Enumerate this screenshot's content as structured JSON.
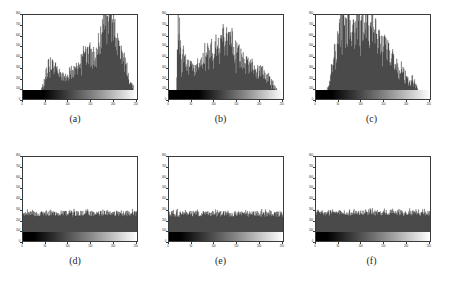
{
  "figure": {
    "caption_prefix": "",
    "panel_count": 6,
    "background": "#ffffff",
    "bar_color": "#4a4a4a",
    "axis_color": "#3a3a3a"
  },
  "chart_data": [
    {
      "type": "bar",
      "name": "panel-a",
      "title": "",
      "caption": "(a)",
      "xlabel": "",
      "ylabel": "",
      "xlim": [
        0,
        255
      ],
      "ylim": [
        0,
        800
      ],
      "xticks": [
        0,
        50,
        100,
        150,
        200,
        250
      ],
      "xticklabels": [
        "0",
        "50",
        "100",
        "150",
        "200",
        "250"
      ],
      "yticks": [
        0,
        100,
        200,
        300,
        400,
        500,
        600,
        700,
        800
      ],
      "yticklabels": [
        "0",
        "100",
        "200",
        "300",
        "400",
        "500",
        "600",
        "700",
        "800"
      ],
      "grid": false,
      "legend": null,
      "colorbar": {
        "type": "grayscale",
        "from": "#000000",
        "to": "#ffffff",
        "black_extent_pct": 18,
        "gamma": 1.0
      },
      "x": [
        0,
        4,
        8,
        12,
        16,
        20,
        24,
        28,
        32,
        36,
        40,
        44,
        48,
        52,
        56,
        60,
        64,
        68,
        72,
        76,
        80,
        84,
        88,
        92,
        96,
        100,
        104,
        108,
        112,
        116,
        120,
        124,
        128,
        132,
        136,
        140,
        144,
        148,
        152,
        156,
        160,
        164,
        168,
        172,
        176,
        180,
        184,
        188,
        192,
        196,
        200,
        204,
        208,
        212,
        216,
        220,
        224,
        228,
        232,
        236,
        240,
        244,
        248,
        252
      ],
      "values": [
        5,
        6,
        8,
        10,
        12,
        14,
        18,
        22,
        30,
        45,
        70,
        110,
        160,
        230,
        300,
        330,
        345,
        320,
        290,
        260,
        240,
        220,
        205,
        195,
        200,
        215,
        235,
        250,
        265,
        270,
        280,
        300,
        330,
        360,
        390,
        420,
        430,
        420,
        400,
        380,
        370,
        400,
        450,
        520,
        600,
        680,
        740,
        790,
        800,
        760,
        700,
        640,
        580,
        520,
        470,
        420,
        380,
        330,
        280,
        230,
        180,
        130,
        90,
        50
      ]
    },
    {
      "type": "bar",
      "name": "panel-b",
      "title": "",
      "caption": "(b)",
      "xlabel": "",
      "ylabel": "",
      "xlim": [
        0,
        255
      ],
      "ylim": [
        0,
        800
      ],
      "xticks": [
        0,
        50,
        100,
        150,
        200,
        250
      ],
      "xticklabels": [
        "0",
        "50",
        "100",
        "150",
        "200",
        "250"
      ],
      "yticks": [
        0,
        100,
        200,
        300,
        400,
        500,
        600,
        700,
        800
      ],
      "yticklabels": [
        "0",
        "100",
        "200",
        "300",
        "400",
        "500",
        "600",
        "700",
        "800"
      ],
      "grid": false,
      "legend": null,
      "colorbar": {
        "type": "grayscale",
        "from": "#000000",
        "to": "#ffffff",
        "black_extent_pct": 26,
        "gamma": 1.0
      },
      "x": [
        0,
        4,
        8,
        12,
        16,
        20,
        24,
        28,
        32,
        36,
        40,
        44,
        48,
        52,
        56,
        60,
        64,
        68,
        72,
        76,
        80,
        84,
        88,
        92,
        96,
        100,
        104,
        108,
        112,
        116,
        120,
        124,
        128,
        132,
        136,
        140,
        144,
        148,
        152,
        156,
        160,
        164,
        168,
        172,
        176,
        180,
        184,
        188,
        192,
        196,
        200,
        204,
        208,
        212,
        216,
        220,
        224,
        228,
        232,
        236,
        240,
        244,
        248,
        252
      ],
      "values": [
        4,
        6,
        10,
        18,
        30,
        800,
        520,
        230,
        470,
        300,
        380,
        260,
        330,
        280,
        250,
        300,
        340,
        290,
        380,
        330,
        400,
        360,
        440,
        400,
        460,
        420,
        480,
        440,
        520,
        470,
        560,
        500,
        540,
        480,
        620,
        520,
        480,
        440,
        420,
        400,
        380,
        360,
        340,
        320,
        300,
        280,
        300,
        270,
        250,
        230,
        260,
        240,
        300,
        260,
        220,
        200,
        180,
        160,
        140,
        120,
        90,
        60,
        40,
        20
      ]
    },
    {
      "type": "bar",
      "name": "panel-c",
      "title": "",
      "caption": "(c)",
      "xlabel": "",
      "ylabel": "",
      "xlim": [
        0,
        255
      ],
      "ylim": [
        0,
        800
      ],
      "xticks": [
        0,
        50,
        100,
        150,
        200,
        250
      ],
      "xticklabels": [
        "0",
        "50",
        "100",
        "150",
        "200",
        "250"
      ],
      "yticks": [
        0,
        100,
        200,
        300,
        400,
        500,
        600,
        700,
        800
      ],
      "yticklabels": [
        "0",
        "100",
        "200",
        "300",
        "400",
        "500",
        "600",
        "700",
        "800"
      ],
      "grid": false,
      "legend": null,
      "colorbar": {
        "type": "grayscale",
        "from": "#000000",
        "to": "#ffffff",
        "black_extent_pct": 14,
        "gamma": 1.0
      },
      "x": [
        0,
        4,
        8,
        12,
        16,
        20,
        24,
        28,
        32,
        36,
        40,
        44,
        48,
        52,
        56,
        60,
        64,
        68,
        72,
        76,
        80,
        84,
        88,
        92,
        96,
        100,
        104,
        108,
        112,
        116,
        120,
        124,
        128,
        132,
        136,
        140,
        144,
        148,
        152,
        156,
        160,
        164,
        168,
        172,
        176,
        180,
        184,
        188,
        192,
        196,
        200,
        204,
        208,
        212,
        216,
        220,
        224,
        228,
        232,
        236,
        240,
        244,
        248,
        252
      ],
      "values": [
        3,
        4,
        6,
        10,
        20,
        40,
        80,
        140,
        220,
        300,
        380,
        450,
        520,
        600,
        660,
        700,
        640,
        600,
        680,
        620,
        560,
        600,
        650,
        700,
        660,
        620,
        680,
        640,
        700,
        660,
        620,
        600,
        640,
        580,
        560,
        540,
        520,
        500,
        480,
        460,
        440,
        420,
        400,
        380,
        340,
        300,
        260,
        220,
        280,
        240,
        200,
        170,
        140,
        120,
        180,
        150,
        110,
        80,
        60,
        40,
        25,
        15,
        8,
        4
      ]
    },
    {
      "type": "bar",
      "name": "panel-d",
      "title": "",
      "caption": "(d)",
      "xlabel": "",
      "ylabel": "",
      "xlim": [
        0,
        255
      ],
      "ylim": [
        0,
        800
      ],
      "xticks": [
        0,
        50,
        100,
        150,
        200,
        250
      ],
      "xticklabels": [
        "0",
        "50",
        "100",
        "150",
        "200",
        "250"
      ],
      "yticks": [
        0,
        100,
        200,
        300,
        400,
        500,
        600,
        700,
        800
      ],
      "yticklabels": [
        "0",
        "100",
        "200",
        "300",
        "400",
        "500",
        "600",
        "700",
        "800"
      ],
      "grid": false,
      "legend": null,
      "colorbar": {
        "type": "grayscale",
        "from": "#000000",
        "to": "#ffffff",
        "black_extent_pct": 10,
        "gamma": 1.0
      },
      "uniform_level": 262,
      "uniform_noise": 26,
      "note": "near-uniform equalized histogram"
    },
    {
      "type": "bar",
      "name": "panel-e",
      "title": "",
      "caption": "(e)",
      "xlabel": "",
      "ylabel": "",
      "xlim": [
        0,
        255
      ],
      "ylim": [
        0,
        800
      ],
      "xticks": [
        0,
        50,
        100,
        150,
        200,
        250
      ],
      "xticklabels": [
        "0",
        "50",
        "100",
        "150",
        "200",
        "250"
      ],
      "yticks": [
        0,
        100,
        200,
        300,
        400,
        500,
        600,
        700,
        800
      ],
      "yticklabels": [
        "0",
        "100",
        "200",
        "300",
        "400",
        "500",
        "600",
        "700",
        "800"
      ],
      "grid": false,
      "legend": null,
      "colorbar": {
        "type": "grayscale",
        "from": "#000000",
        "to": "#ffffff",
        "black_extent_pct": 10,
        "gamma": 1.0
      },
      "uniform_level": 258,
      "uniform_noise": 28,
      "note": "near-uniform equalized histogram"
    },
    {
      "type": "bar",
      "name": "panel-f",
      "title": "",
      "caption": "(f)",
      "xlabel": "",
      "ylabel": "",
      "xlim": [
        0,
        255
      ],
      "ylim": [
        0,
        800
      ],
      "xticks": [
        0,
        50,
        100,
        150,
        200,
        250
      ],
      "xticklabels": [
        "0",
        "50",
        "100",
        "150",
        "200",
        "250"
      ],
      "yticks": [
        0,
        100,
        200,
        300,
        400,
        500,
        600,
        700,
        800
      ],
      "yticklabels": [
        "0",
        "100",
        "200",
        "300",
        "400",
        "500",
        "600",
        "700",
        "800"
      ],
      "grid": false,
      "legend": null,
      "colorbar": {
        "type": "grayscale",
        "from": "#000000",
        "to": "#ffffff",
        "black_extent_pct": 10,
        "gamma": 1.0
      },
      "uniform_level": 268,
      "uniform_noise": 26,
      "note": "near-uniform equalized histogram"
    }
  ]
}
